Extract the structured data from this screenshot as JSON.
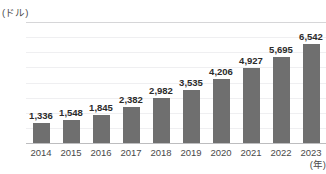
{
  "chart_data": {
    "type": "bar",
    "title": "",
    "xlabel": "(年)",
    "ylabel": "(ドル)",
    "categories": [
      "2014",
      "2015",
      "2016",
      "2017",
      "2018",
      "2019",
      "2020",
      "2021",
      "2022",
      "2023"
    ],
    "values": [
      1336,
      1548,
      1845,
      2382,
      2982,
      3535,
      4206,
      4927,
      5695,
      6542
    ],
    "value_labels": [
      "1,336",
      "1,548",
      "1,845",
      "2,382",
      "2,982",
      "3,535",
      "4,206",
      "4,927",
      "5,695",
      "6,542"
    ],
    "value_unit_scale": "億",
    "ytick_labels": [
      "8 兆",
      "7 兆",
      "6 兆",
      "5 兆",
      "4 兆",
      "3 兆",
      "2 兆",
      "1 兆",
      "0"
    ],
    "ytick_values": [
      8000,
      7000,
      6000,
      5000,
      4000,
      3000,
      2000,
      1000,
      0
    ],
    "ylim": [
      0,
      8000
    ],
    "grid": true,
    "legend": null,
    "bar_color": "#6f6f6f",
    "gridline_color": "#efeff1",
    "axis_color": "#bdbdbf",
    "text_color": "#4a4a4a"
  }
}
